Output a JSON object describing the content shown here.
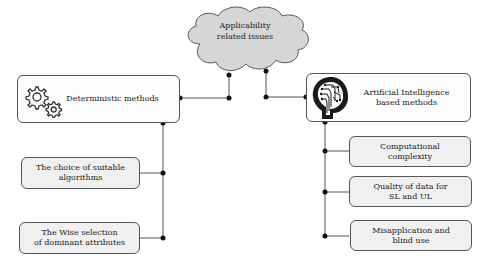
{
  "diagram": {
    "cloud": {
      "label": "Applicability\nrelated issues",
      "fill": "#d6d6d6"
    },
    "left_branch": {
      "main": {
        "label": "Deterministic methods",
        "icon": "gears-icon"
      },
      "children": [
        {
          "label": "The choice of  suitable\nalgorithms"
        },
        {
          "label": "The Wise selection\nof dominant attributes"
        }
      ]
    },
    "right_branch": {
      "main": {
        "label": "Artificial Intelligence\nbased methods",
        "icon": "ai-head-icon"
      },
      "children": [
        {
          "label": "Computational\ncomplexity"
        },
        {
          "label": "Quality of data for\nSL and UL"
        },
        {
          "label": "Misapplication and\nblind use"
        }
      ]
    },
    "colors": {
      "line": "#555555",
      "node": "#111111",
      "box_border": "#555555",
      "sub_fill": "#f0f0f0"
    }
  }
}
